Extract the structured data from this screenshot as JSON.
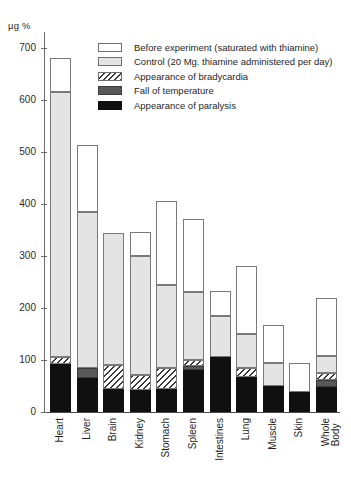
{
  "chart_data": {
    "type": "bar",
    "stacked": true,
    "title": "",
    "xlabel": "",
    "ylabel": "µg %",
    "ylim": [
      0,
      730
    ],
    "ytick_values": [
      0,
      100,
      200,
      300,
      400,
      500,
      600,
      700
    ],
    "ytick_labels": [
      "0",
      "100",
      "200",
      "300",
      "400",
      "500",
      "600",
      "700"
    ],
    "grid": false,
    "legend_position": "top-right",
    "categories": [
      "Heart",
      "Liver",
      "Brain",
      "Kidney",
      "Stomach",
      "Spleen",
      "Intestines",
      "Lung",
      "Muscle",
      "Skin",
      "Whole\nBody"
    ],
    "series": [
      {
        "name": "Appearance of paralysis",
        "key": "paralysis",
        "color": "#101010",
        "values": [
          92,
          65,
          45,
          42,
          45,
          80,
          105,
          67,
          50,
          38,
          48
        ]
      },
      {
        "name": "Fall of temperature",
        "key": "fall",
        "color": "#585858",
        "values": [
          0,
          20,
          0,
          0,
          0,
          8,
          0,
          0,
          0,
          0,
          14
        ]
      },
      {
        "name": "Appearance of bradycardia",
        "key": "brady",
        "color": "hatched",
        "values": [
          13,
          0,
          45,
          30,
          40,
          12,
          0,
          18,
          0,
          0,
          13
        ]
      },
      {
        "name": "Control (20 Mg. thiamine administered per day)",
        "key": "control",
        "color": "#e4e4e4",
        "values": [
          510,
          300,
          255,
          228,
          160,
          130,
          80,
          65,
          45,
          0,
          32
        ]
      },
      {
        "name": "Before experiment (saturated with thiamine)",
        "key": "before",
        "color": "#ffffff",
        "values": [
          65,
          128,
          0,
          47,
          160,
          142,
          47,
          130,
          72,
          57,
          113
        ]
      }
    ],
    "totals": [
      680,
      513,
      345,
      347,
      405,
      372,
      232,
      280,
      167,
      95,
      220
    ],
    "cumulative_tops": {
      "Heart": {
        "paralysis": 92,
        "fall": 92,
        "brady": 105,
        "control": 615,
        "before": 680
      },
      "Liver": {
        "paralysis": 65,
        "fall": 85,
        "brady": 85,
        "control": 385,
        "before": 513
      },
      "Brain": {
        "paralysis": 45,
        "fall": 45,
        "brady": 90,
        "control": 345,
        "before": 345
      },
      "Kidney": {
        "paralysis": 42,
        "fall": 42,
        "brady": 72,
        "control": 300,
        "before": 347
      },
      "Stomach": {
        "paralysis": 45,
        "fall": 45,
        "brady": 85,
        "control": 245,
        "before": 405
      },
      "Spleen": {
        "paralysis": 80,
        "fall": 88,
        "brady": 100,
        "control": 230,
        "before": 372
      },
      "Intestines": {
        "paralysis": 105,
        "fall": 105,
        "brady": 105,
        "control": 185,
        "before": 232
      },
      "Lung": {
        "paralysis": 67,
        "fall": 67,
        "brady": 85,
        "control": 150,
        "before": 280
      },
      "Muscle": {
        "paralysis": 50,
        "fall": 50,
        "brady": 50,
        "control": 95,
        "before": 167
      },
      "Skin": {
        "paralysis": 38,
        "fall": 38,
        "brady": 38,
        "control": 38,
        "before": 95
      },
      "Whole Body": {
        "paralysis": 48,
        "fall": 62,
        "brady": 75,
        "control": 107,
        "before": 220
      }
    }
  },
  "legend": {
    "items": [
      {
        "label": "Before experiment (saturated with thiamine)",
        "key": "before"
      },
      {
        "label": "Control (20 Mg. thiamine administered per day)",
        "key": "control"
      },
      {
        "label": "Appearance of bradycardia",
        "key": "brady"
      },
      {
        "label": "Fall of temperature",
        "key": "fall"
      },
      {
        "label": "Appearance of paralysis",
        "key": "paralysis"
      }
    ]
  }
}
